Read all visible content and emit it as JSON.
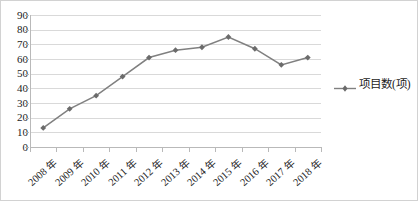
{
  "chart_data": {
    "type": "line",
    "title": "",
    "xlabel": "",
    "ylabel": "",
    "categories": [
      "2008 年",
      "2009 年",
      "2010 年",
      "2011 年",
      "2012 年",
      "2013 年",
      "2014 年",
      "2015 年",
      "2016 年",
      "2017 年",
      "2018 年"
    ],
    "series": [
      {
        "name": "项目数(项)",
        "values": [
          13,
          26,
          35,
          48,
          61,
          66,
          68,
          75,
          67,
          56,
          61
        ]
      }
    ],
    "ylim": [
      0,
      90
    ],
    "ytick_labels": [
      "90",
      "80",
      "70",
      "60",
      "50",
      "40",
      "30",
      "20",
      "10",
      "0"
    ],
    "ytick_values": [
      90,
      80,
      70,
      60,
      50,
      40,
      30,
      20,
      10,
      0
    ],
    "grid": true,
    "legend_position": "right",
    "marker": "diamond",
    "line_color": "#808080",
    "marker_color": "#6b6b6b",
    "grid_color": "#d9d9d9",
    "axis_color": "#b9b9b9",
    "background_color": "#ffffff",
    "border_color": "#d2d2d2"
  },
  "legend": {
    "label": "项目数(项)"
  }
}
